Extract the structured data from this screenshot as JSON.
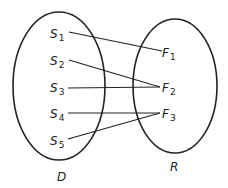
{
  "diagram": {
    "type": "set-mapping",
    "colors": {
      "stroke": "#222222",
      "background": "#ffffff"
    },
    "sets": [
      {
        "id": "D",
        "label": "D",
        "cx": 59,
        "cy": 86,
        "rx": 46,
        "ry": 74,
        "label_x": 57,
        "label_y": 181
      },
      {
        "id": "R",
        "label": "R",
        "cx": 175,
        "cy": 86,
        "rx": 42,
        "ry": 67,
        "label_x": 170,
        "label_y": 171
      }
    ],
    "domain_elements": [
      {
        "id": "S1",
        "base": "S",
        "sub": "1",
        "x": 50,
        "y": 38,
        "ax": 69,
        "ay": 32
      },
      {
        "id": "S2",
        "base": "S",
        "sub": "2",
        "x": 50,
        "y": 65,
        "ax": 69,
        "ay": 60
      },
      {
        "id": "S3",
        "base": "S",
        "sub": "3",
        "x": 50,
        "y": 92,
        "ax": 68,
        "ay": 88
      },
      {
        "id": "S4",
        "base": "S",
        "sub": "4",
        "x": 50,
        "y": 118,
        "ax": 68,
        "ay": 113
      },
      {
        "id": "S5",
        "base": "S",
        "sub": "5",
        "x": 50,
        "y": 145,
        "ax": 68,
        "ay": 139
      }
    ],
    "range_elements": [
      {
        "id": "F1",
        "base": "F",
        "sub": "1",
        "x": 162,
        "y": 57,
        "ax": 162,
        "ay": 51
      },
      {
        "id": "F2",
        "base": "F",
        "sub": "2",
        "x": 162,
        "y": 92,
        "ax": 160,
        "ay": 87
      },
      {
        "id": "F3",
        "base": "F",
        "sub": "3",
        "x": 162,
        "y": 118,
        "ax": 160,
        "ay": 113
      }
    ],
    "mappings": [
      {
        "from": "S1",
        "to": "F1"
      },
      {
        "from": "S2",
        "to": "F2"
      },
      {
        "from": "S3",
        "to": "F2"
      },
      {
        "from": "S4",
        "to": "F3"
      },
      {
        "from": "S5",
        "to": "F3"
      }
    ]
  }
}
